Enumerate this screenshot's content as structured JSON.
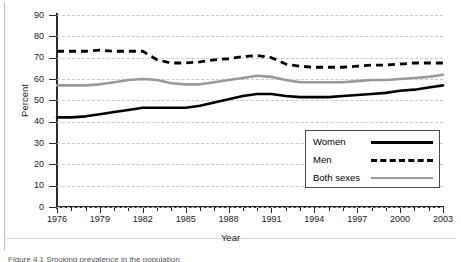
{
  "figure": {
    "caption": "Figure 4.1  Smoking prevalence in the population"
  },
  "legend": {
    "position": "bottom-right",
    "items": [
      {
        "label": "Women",
        "style": "solid-black",
        "color": "#000000"
      },
      {
        "label": "Men",
        "style": "dashed-black",
        "color": "#000000"
      },
      {
        "label": "Both sexes",
        "style": "solid-gray",
        "color": "#9a9a9a"
      }
    ]
  },
  "chart_data": {
    "type": "line",
    "title": "",
    "xlabel": "Year",
    "ylabel": "Percent",
    "xlim": [
      1976,
      2003
    ],
    "ylim": [
      0,
      90
    ],
    "ytick_step": 10,
    "yticks": [
      0,
      10,
      20,
      30,
      40,
      50,
      60,
      70,
      80,
      90
    ],
    "xticks": [
      1976,
      1979,
      1982,
      1985,
      1988,
      1991,
      1994,
      1997,
      2000,
      2003
    ],
    "xtick_minor_step": 1,
    "grid": "horizontal-dashed",
    "x": [
      1976,
      1977,
      1978,
      1979,
      1980,
      1981,
      1982,
      1983,
      1984,
      1985,
      1986,
      1987,
      1988,
      1989,
      1990,
      1991,
      1992,
      1993,
      1994,
      1995,
      1996,
      1997,
      1998,
      1999,
      2000,
      2001,
      2002,
      2003
    ],
    "series": [
      {
        "name": "Women",
        "color": "#000000",
        "style": "solid",
        "values": [
          42,
          42,
          42.5,
          43.5,
          44.5,
          45.5,
          46.5,
          46.5,
          46.5,
          46.5,
          47.5,
          49,
          50.5,
          52,
          53,
          53,
          52,
          51.5,
          51.5,
          51.5,
          52,
          52.5,
          53,
          53.5,
          54.5,
          55,
          56,
          57
        ]
      },
      {
        "name": "Men",
        "color": "#000000",
        "style": "dashed",
        "values": [
          73,
          73,
          73,
          73.5,
          73,
          73,
          73,
          69,
          67.5,
          67.5,
          68,
          69,
          69.5,
          70.5,
          71,
          70,
          67,
          66,
          65.5,
          65.5,
          65.5,
          66,
          66.5,
          66.5,
          67,
          67.5,
          67.5,
          67.5
        ]
      },
      {
        "name": "Both sexes",
        "color": "#9a9a9a",
        "style": "solid",
        "values": [
          57,
          57,
          57,
          57.5,
          58.5,
          59.5,
          60,
          59.5,
          58,
          57.5,
          57.5,
          58.5,
          59.5,
          60.5,
          61.5,
          61,
          59.5,
          58.5,
          58.5,
          58.5,
          58.5,
          59,
          59.5,
          59.5,
          60,
          60.5,
          61,
          62
        ]
      }
    ]
  }
}
